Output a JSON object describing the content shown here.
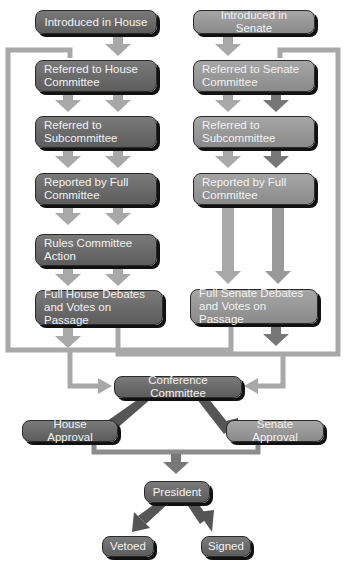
{
  "colors": {
    "house_box": "#666666",
    "senate_box": "#999999",
    "arrow_light": "#a8a8a8",
    "arrow_dark": "#555555",
    "line": "#a8a8a8"
  },
  "house": {
    "steps": [
      {
        "label": "Introduced in House"
      },
      {
        "label": "Referred to House\nCommittee"
      },
      {
        "label": "Referred to\nSubcommittee"
      },
      {
        "label": "Reported by Full\nCommittee"
      },
      {
        "label": "Rules Committee\nAction"
      },
      {
        "label": "Full House Debates\nand Votes on Passage"
      }
    ]
  },
  "senate": {
    "steps": [
      {
        "label": "Introduced in Senate"
      },
      {
        "label": "Referred to Senate\nCommittee"
      },
      {
        "label": "Referred to\nSubcommittee"
      },
      {
        "label": "Reported by Full\nCommittee"
      },
      {
        "label": "Full Senate Debates\nand Votes on Passage"
      }
    ]
  },
  "conference": {
    "label": "Conference Committee"
  },
  "house_approval": {
    "label": "House Approval"
  },
  "senate_approval": {
    "label": "Senate Approval"
  },
  "president": {
    "label": "President"
  },
  "vetoed": {
    "label": "Vetoed"
  },
  "signed": {
    "label": "Signed"
  }
}
